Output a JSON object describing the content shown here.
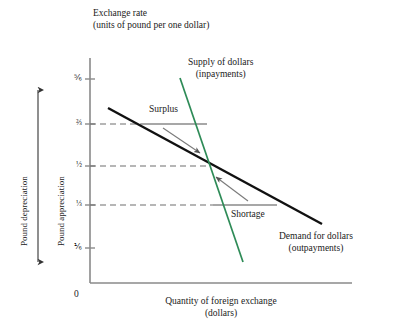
{
  "figure": {
    "type": "economics-supply-demand-diagram",
    "y_axis_title_line1": "Exchange rate",
    "y_axis_title_line2": "(units of pound per one dollar)",
    "x_axis_title_line1": "Quantity of foreign exchange",
    "x_axis_title_line2": "(dollars)",
    "origin_label": "0"
  },
  "colors": {
    "supply_curve": "#2e8b57",
    "demand_curve": "#111111",
    "axis": "#8a8a8a",
    "dashed_gridline": "#6f6f6f",
    "region_line": "#8a8a8a",
    "arrow": "#7a7a7a",
    "text": "#1a1a1a"
  },
  "y_ticks": [
    {
      "label": "⅚",
      "value": 0.8333,
      "y": 79,
      "gridline": false
    },
    {
      "label": "⅔",
      "value": 0.6667,
      "y": 124,
      "gridline": true
    },
    {
      "label": "½",
      "value": 0.5,
      "y": 166,
      "gridline": true
    },
    {
      "label": "⅓",
      "value": 0.3333,
      "y": 205,
      "gridline": true
    },
    {
      "label": "⅙",
      "value": 0.1667,
      "y": 248,
      "gridline": false
    }
  ],
  "curves": [
    {
      "name": "supply-of-dollars",
      "label_line1": "Supply of dollars",
      "label_line2": "(inpayments)",
      "color": "#2e8b57",
      "points": [
        [
          180,
          78
        ],
        [
          243,
          262
        ]
      ]
    },
    {
      "name": "demand-for-dollars",
      "label_line1": "Demand for dollars",
      "label_line2": "(outpayments)",
      "color": "#111111",
      "points": [
        [
          108,
          108
        ],
        [
          322,
          224
        ]
      ]
    }
  ],
  "regions": [
    {
      "name": "surplus",
      "label": "Surplus",
      "at_exchange_rate": "⅔",
      "segment": [
        [
          141,
          124
        ],
        [
          207,
          124
        ]
      ]
    },
    {
      "name": "shortage",
      "label": "Shortage",
      "at_exchange_rate": "⅓",
      "segment": [
        [
          213,
          205
        ],
        [
          277,
          205
        ]
      ]
    }
  ],
  "equilibrium": {
    "name": "equilibrium-point",
    "exchange_rate": "½",
    "x": 211,
    "y": 164
  },
  "adjustment_arrows": [
    {
      "name": "downward-adjustment-arrow",
      "from": [
        163,
        128
      ],
      "to": [
        200,
        153
      ]
    },
    {
      "name": "upward-adjustment-arrow",
      "from": [
        248,
        201
      ],
      "to": [
        216,
        177
      ]
    }
  ],
  "side_labels": {
    "depreciation": "Pound depreciation",
    "appreciation": "Pound appreciation"
  }
}
